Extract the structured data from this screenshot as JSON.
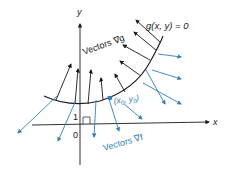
{
  "diagram": {
    "axis_labels": {
      "x": "x",
      "y": "y"
    },
    "tick_labels": {
      "one": "1",
      "zero": "0"
    },
    "curve_label": "g(x, y) = 0",
    "point_label_main": "(x",
    "point_label_sub0": "0",
    "point_label_mid": ", y",
    "point_label_sub1": "0",
    "point_label_end": ")",
    "grad_g_label": "Vectors ∇g",
    "grad_f_label": "Vectors ∇f",
    "colors": {
      "black": "#1a1a1a",
      "blue": "#2f7fc1"
    }
  }
}
